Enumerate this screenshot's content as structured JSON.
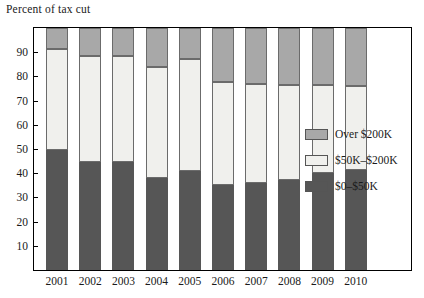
{
  "chart_data": {
    "type": "bar",
    "subtype": "stacked-bar-100",
    "title": "",
    "ylabel": "Percent of tax cut",
    "xlabel": "",
    "ylim": [
      0,
      100
    ],
    "yticks": [
      10,
      20,
      30,
      40,
      50,
      60,
      70,
      80,
      90
    ],
    "grid": false,
    "legend_position": "right",
    "categories": [
      "2001",
      "2002",
      "2003",
      "2004",
      "2005",
      "2006",
      "2007",
      "2008",
      "2009",
      "2010"
    ],
    "series": [
      {
        "name": "$0–$50K",
        "color": "#565656",
        "values": [
          49.5,
          44.5,
          44.5,
          38.0,
          41.0,
          35.0,
          36.0,
          37.0,
          40.0,
          41.5
        ]
      },
      {
        "name": "$50K–$200K",
        "color": "#f0f0ed",
        "values": [
          42.0,
          44.0,
          44.0,
          46.0,
          46.0,
          42.5,
          41.0,
          39.5,
          36.5,
          34.5
        ]
      },
      {
        "name": "Over $200K",
        "color": "#a8a8a8",
        "values": [
          8.5,
          11.5,
          11.5,
          16.0,
          13.0,
          22.5,
          23.0,
          23.5,
          23.5,
          24.0
        ]
      }
    ],
    "stack_tops": {
      "low": [
        49.5,
        44.5,
        44.5,
        38.0,
        41.0,
        35.0,
        36.0,
        37.0,
        40.0,
        41.5
      ],
      "mid": [
        91.5,
        88.5,
        88.5,
        84.0,
        87.0,
        77.5,
        77.0,
        76.5,
        76.5,
        76.0
      ],
      "high": [
        100,
        100,
        100,
        100,
        100,
        100,
        100,
        100,
        100,
        100
      ]
    }
  },
  "legend": {
    "items": [
      {
        "label": "Over $200K",
        "color": "#a8a8a8"
      },
      {
        "label": "$50K–$200K",
        "color": "#f0f0ed"
      },
      {
        "label": "$0–$50K",
        "color": "#565656"
      }
    ]
  }
}
